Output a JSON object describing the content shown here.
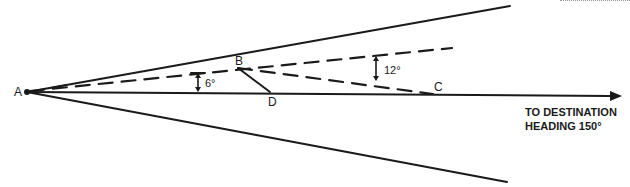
{
  "diagram": {
    "colors": {
      "ink": "#1a1a1a",
      "background": "#ffffff"
    },
    "points": {
      "A": {
        "label": "A"
      },
      "B": {
        "label": "B"
      },
      "C": {
        "label": "C"
      },
      "D": {
        "label": "D"
      }
    },
    "angles": {
      "small": {
        "label": "6°"
      },
      "large": {
        "label": "12°"
      }
    },
    "destination": {
      "line1": "TO DESTINATION",
      "line2": "HEADING 150°"
    }
  }
}
